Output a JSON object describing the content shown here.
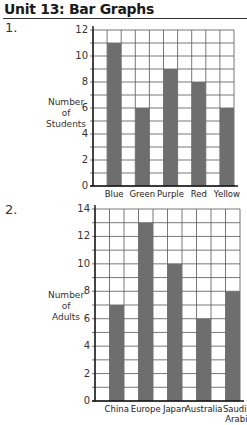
{
  "header": {
    "title": "Unit 13: Bar Graphs"
  },
  "questions": [
    {
      "number": "1.",
      "ylabel_lines": [
        "Number",
        "of",
        "Students"
      ]
    },
    {
      "number": "2.",
      "ylabel_lines": [
        "Number",
        "of",
        "Adults"
      ]
    }
  ],
  "chart_data": [
    {
      "type": "bar",
      "title": "",
      "categories": [
        "Blue",
        "Green",
        "Purple",
        "Red",
        "Yellow"
      ],
      "values": [
        11,
        6,
        9,
        8,
        6
      ],
      "xlabel": "",
      "ylabel": "Number of Students",
      "ylim": [
        0,
        12
      ],
      "yticks": [
        0,
        2,
        4,
        6,
        8,
        10,
        12
      ],
      "grid": true,
      "bar_color": "#6e6e6e"
    },
    {
      "type": "bar",
      "title": "",
      "categories": [
        "China",
        "Europe",
        "Japan",
        "Australia",
        "Saudi Arabia"
      ],
      "values": [
        7,
        13,
        10,
        6,
        8
      ],
      "xlabel": "",
      "ylabel": "Number of Adults",
      "ylim": [
        0,
        14
      ],
      "yticks": [
        0,
        2,
        4,
        6,
        8,
        10,
        12,
        14
      ],
      "grid": true,
      "bar_color": "#6e6e6e"
    }
  ]
}
